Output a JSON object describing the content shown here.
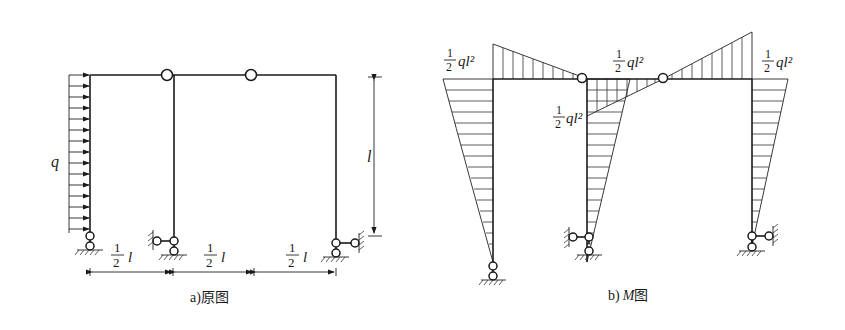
{
  "diagram_a": {
    "caption": "a)原图",
    "load_label": "q",
    "height_label": "l",
    "span_labels": [
      {
        "num": "1",
        "den": "2",
        "var": "l"
      },
      {
        "num": "1",
        "den": "2",
        "var": "l"
      },
      {
        "num": "1",
        "den": "2",
        "var": "l"
      }
    ]
  },
  "diagram_b": {
    "caption_prefix": "b)",
    "caption_var": "M",
    "caption_suffix": "图",
    "moment_labels": [
      {
        "id": "left-column-top",
        "num": "1",
        "den": "2",
        "expr": "ql²"
      },
      {
        "id": "middle-beam",
        "num": "1",
        "den": "2",
        "expr": "ql²"
      },
      {
        "id": "middle-column-top",
        "num": "1",
        "den": "2",
        "expr": "ql²"
      },
      {
        "id": "right-column-top",
        "num": "1",
        "den": "2",
        "expr": "ql²"
      }
    ]
  }
}
